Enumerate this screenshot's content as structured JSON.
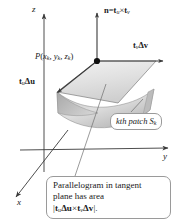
{
  "figure": {
    "background_color": "#ffffff",
    "line_color": "#3a3a3a",
    "callout_border_color": "#9a9a9a",
    "surface_fill_light": "#e8e8e8",
    "surface_fill_dark": "#b9b9b9"
  },
  "axes": {
    "z_label": "z",
    "y_label": "y",
    "x_label": "x"
  },
  "vectors": {
    "normal_label_prefix": "n",
    "normal_label_eq": "=",
    "normal_label_tu": "t",
    "normal_label_tu_sub": "u",
    "normal_label_cross": "×",
    "normal_label_tv": "t",
    "normal_label_tv_sub": "v",
    "normal_label_full": "n = t_u × t_v",
    "tv_dv_base": "t",
    "tv_dv_sub": "v",
    "tv_dv_delta": "Δv",
    "tv_dv_full": "t_v Δv",
    "tu_du_base": "t",
    "tu_du_sub": "u",
    "tu_du_delta": "Δu",
    "tu_du_full": "t_u Δu"
  },
  "point": {
    "name": "P",
    "open_paren": "(",
    "x_var": "x",
    "x_sub": "k",
    "comma1": ", ",
    "y_var": "y",
    "y_sub": "k",
    "comma2": ", ",
    "z_var": "z",
    "z_sub": "k",
    "close_paren": ")",
    "full": "P(x_k, y_k, z_k)"
  },
  "callouts": {
    "patch": {
      "prefix": "kth patch ",
      "symbol": "S",
      "symbol_sub": "k",
      "full": "kth patch S_k"
    },
    "area": {
      "line1": "Parallelogram in tangent",
      "line2": "plane has area",
      "line3_open": "|",
      "line3_tu": "t",
      "line3_tu_sub": "u",
      "line3_du": "Δu",
      "line3_cross": "×",
      "line3_tv": "t",
      "line3_tv_sub": "v",
      "line3_dv": "Δv",
      "line3_close": "|.",
      "full": "|t_u Δu × t_v Δv|."
    }
  }
}
